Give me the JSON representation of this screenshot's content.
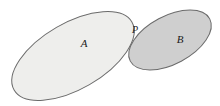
{
  "figure": {
    "type": "venn-tangent-ellipses",
    "background_color": "#ffffff",
    "width": 220,
    "height": 106,
    "stroke_color": "#5a5a5a",
    "stroke_width": 1
  },
  "shapes": {
    "ellipse_a": {
      "label": "A",
      "fill_color": "#eeeeec",
      "stroke_color": "#6b6b6b",
      "center_x": 73,
      "center_y": 56,
      "radius_x": 68,
      "radius_y": 33,
      "rotation_deg": -30,
      "label_x": 84,
      "label_y": 47
    },
    "ellipse_b": {
      "label": "B",
      "fill_color": "#cfcfcf",
      "stroke_color": "#6b6b6b",
      "center_x": 170,
      "center_y": 40,
      "radius_x": 45,
      "radius_y": 24,
      "rotation_deg": -28,
      "label_x": 180,
      "label_y": 43
    },
    "point_p": {
      "label": "P",
      "x": 132,
      "y": 27,
      "label_x": 135,
      "label_y": 33
    }
  },
  "labels": {
    "a": "A",
    "b": "B",
    "p": "P"
  }
}
